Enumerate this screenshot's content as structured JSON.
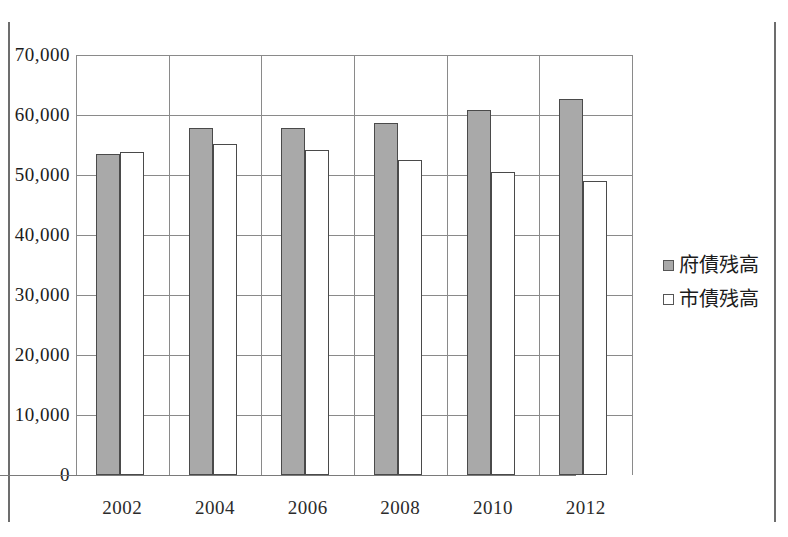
{
  "chart_data": {
    "type": "bar",
    "title": "",
    "xlabel": "",
    "ylabel": "",
    "categories": [
      "2002",
      "2004",
      "2006",
      "2008",
      "2010",
      "2012"
    ],
    "series": [
      {
        "name": "府債残高",
        "color": "#a9a9a9",
        "values": [
          53500,
          57800,
          57800,
          58600,
          60800,
          62600
        ]
      },
      {
        "name": "市債残高",
        "color": "#ffffff",
        "values": [
          53800,
          55200,
          54200,
          52500,
          50500,
          49000
        ]
      }
    ],
    "ylim": [
      0,
      70000
    ],
    "yticks": [
      {
        "value": 70000,
        "label": "70,000"
      },
      {
        "value": 60000,
        "label": "60,000"
      },
      {
        "value": 50000,
        "label": "50,000"
      },
      {
        "value": 40000,
        "label": "40,000"
      },
      {
        "value": 30000,
        "label": "30,000"
      },
      {
        "value": 20000,
        "label": "20,000"
      },
      {
        "value": 10000,
        "label": "10,000"
      },
      {
        "value": 0,
        "label": "0"
      }
    ],
    "grid": "horizontal-and-category-separators",
    "legend_position": "right",
    "legend": [
      {
        "label": "府債残高",
        "marker": "filled-gray-square"
      },
      {
        "label": "市債残高",
        "marker": "hollow-white-square"
      }
    ]
  }
}
